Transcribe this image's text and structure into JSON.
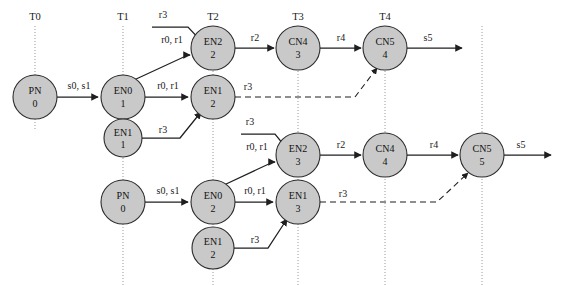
{
  "figure": {
    "background_color": "#ffffff",
    "node_fill_color": "#c9c9c9",
    "node_stroke_color": "#2b2b2b",
    "edge_color": "#1f1f1f",
    "timeline_color": "#9a9a9a"
  },
  "timelines": [
    {
      "id": "t0",
      "label": "T0",
      "x": 35
    },
    {
      "id": "t1",
      "label": "T1",
      "x": 123
    },
    {
      "id": "t2",
      "label": "T2",
      "x": 213
    },
    {
      "id": "t3",
      "label": "T3",
      "x": 298
    },
    {
      "id": "t4",
      "label": "T4",
      "x": 385
    },
    {
      "id": "t5",
      "label": "",
      "x": 482
    }
  ],
  "nodes": [
    {
      "id": "n1",
      "name": "PN",
      "index": "0",
      "cx": 35,
      "cy": 97,
      "r": 22
    },
    {
      "id": "n2",
      "name": "EN0",
      "index": "1",
      "cx": 123,
      "cy": 97,
      "r": 22
    },
    {
      "id": "n3",
      "name": "EN1",
      "index": "1",
      "cx": 123,
      "cy": 138,
      "r": 19
    },
    {
      "id": "n4",
      "name": "EN2",
      "index": "2",
      "cx": 213,
      "cy": 48,
      "r": 22
    },
    {
      "id": "n5",
      "name": "EN1",
      "index": "2",
      "cx": 213,
      "cy": 97,
      "r": 22
    },
    {
      "id": "n6",
      "name": "CN4",
      "index": "3",
      "cx": 298,
      "cy": 48,
      "r": 22
    },
    {
      "id": "n7",
      "name": "CN5",
      "index": "4",
      "cx": 385,
      "cy": 48,
      "r": 22
    },
    {
      "id": "n8",
      "name": "PN",
      "index": "0",
      "cx": 123,
      "cy": 202,
      "r": 22
    },
    {
      "id": "n9",
      "name": "EN0",
      "index": "2",
      "cx": 213,
      "cy": 202,
      "r": 22
    },
    {
      "id": "n10",
      "name": "EN1",
      "index": "2",
      "cx": 213,
      "cy": 248,
      "r": 21
    },
    {
      "id": "n11",
      "name": "EN2",
      "index": "3",
      "cx": 298,
      "cy": 155,
      "r": 22
    },
    {
      "id": "n12",
      "name": "EN1",
      "index": "3",
      "cx": 298,
      "cy": 202,
      "r": 22
    },
    {
      "id": "n13",
      "name": "CN4",
      "index": "4",
      "cx": 385,
      "cy": 155,
      "r": 22
    },
    {
      "id": "n14",
      "name": "CN5",
      "index": "5",
      "cx": 482,
      "cy": 155,
      "r": 22
    }
  ],
  "edges": [
    {
      "id": "e1",
      "label": "s0, s1",
      "style": "solid",
      "from": "n1",
      "to": "n2",
      "label_x": 79,
      "label_y": 89
    },
    {
      "id": "e2",
      "label": "r0, r1",
      "style": "solid",
      "from": "n2",
      "to": "n5",
      "label_x": 168,
      "label_y": 89
    },
    {
      "id": "e3",
      "label": "r0, r1",
      "style": "solid",
      "from": "n2",
      "to": "n4",
      "label_x": 172,
      "label_y": 43
    },
    {
      "id": "e4",
      "label": "r3",
      "style": "solid",
      "from": "input-top",
      "to": "n4",
      "label_x": 163,
      "label_y": 18
    },
    {
      "id": "e5",
      "label": "r3",
      "style": "solid",
      "from": "n3",
      "to": "n5",
      "label_x": 163,
      "label_y": 133
    },
    {
      "id": "e6",
      "label": "r2",
      "style": "solid",
      "from": "n4",
      "to": "n6",
      "label_x": 255,
      "label_y": 41
    },
    {
      "id": "e7",
      "label": "r4",
      "style": "solid",
      "from": "n6",
      "to": "n7",
      "label_x": 341,
      "label_y": 41
    },
    {
      "id": "e8",
      "label": "s5",
      "style": "solid",
      "from": "n7",
      "to": "output-top",
      "label_x": 428,
      "label_y": 41
    },
    {
      "id": "e9",
      "label": "r3",
      "style": "dashed",
      "from": "n5",
      "to": "n7",
      "label_x": 248,
      "label_y": 90
    },
    {
      "id": "e10",
      "label": "s0, s1",
      "style": "solid",
      "from": "n8",
      "to": "n9",
      "label_x": 168,
      "label_y": 194
    },
    {
      "id": "e11",
      "label": "r0, r1",
      "style": "solid",
      "from": "n9",
      "to": "n12",
      "label_x": 255,
      "label_y": 194
    },
    {
      "id": "e12",
      "label": "r0, r1",
      "style": "solid",
      "from": "n9",
      "to": "n11",
      "label_x": 257,
      "label_y": 150
    },
    {
      "id": "e13",
      "label": "r3",
      "style": "solid",
      "from": "input-bottom",
      "to": "n11",
      "label_x": 250,
      "label_y": 125
    },
    {
      "id": "e14",
      "label": "r3",
      "style": "solid",
      "from": "n10",
      "to": "n12",
      "label_x": 255,
      "label_y": 243
    },
    {
      "id": "e15",
      "label": "r2",
      "style": "solid",
      "from": "n11",
      "to": "n13",
      "label_x": 341,
      "label_y": 148
    },
    {
      "id": "e16",
      "label": "r4",
      "style": "solid",
      "from": "n13",
      "to": "n14",
      "label_x": 434,
      "label_y": 148
    },
    {
      "id": "e17",
      "label": "s5",
      "style": "solid",
      "from": "n14",
      "to": "output-bottom",
      "label_x": 521,
      "label_y": 148
    },
    {
      "id": "e18",
      "label": "r3",
      "style": "dashed",
      "from": "n12",
      "to": "n14",
      "label_x": 343,
      "label_y": 197
    }
  ]
}
